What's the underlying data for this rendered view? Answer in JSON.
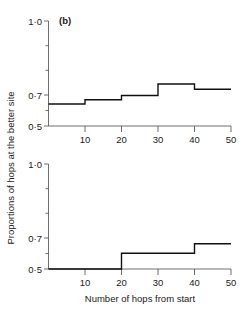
{
  "figure": {
    "panel_label": "(b)",
    "xlabel": "Number of hops from start",
    "ylabel": "Proportions of hops at the better site",
    "background_color": "#ffffff",
    "line_color": "#101010",
    "axis_color": "#4a4a4a"
  },
  "chart_data": [
    {
      "type": "line",
      "subtype": "step",
      "panel": "(b) upper",
      "title": "(b)",
      "xlabel": "",
      "ylabel": "Proportions of hops at the better site",
      "xlim": [
        0,
        50
      ],
      "ylim": [
        0.5,
        1.0
      ],
      "xticks": [
        10,
        20,
        30,
        40,
        50
      ],
      "xtick_labels": [
        "10",
        "20",
        "30",
        "40",
        "50"
      ],
      "yticks": [
        0.5,
        0.7,
        1.0
      ],
      "ytick_labels": [
        "0·5",
        "0·7",
        "1·0"
      ],
      "yminor_ticks": [
        0.6,
        0.8,
        0.9
      ],
      "grid": false,
      "legend": null,
      "x_edges": [
        0,
        10,
        20,
        30,
        40,
        50
      ],
      "values": [
        0.605,
        0.625,
        0.645,
        0.7,
        0.675
      ],
      "series": [
        {
          "name": "proportion at better site",
          "x_edges": [
            0,
            10,
            20,
            30,
            40,
            50
          ],
          "values": [
            0.605,
            0.625,
            0.645,
            0.7,
            0.675
          ]
        }
      ]
    },
    {
      "type": "line",
      "subtype": "step",
      "panel": "(b) lower",
      "title": "",
      "xlabel": "Number of hops from start",
      "ylabel": "Proportions of hops at the better site",
      "xlim": [
        0,
        50
      ],
      "ylim": [
        0.5,
        1.0
      ],
      "xticks": [
        10,
        20,
        30,
        40,
        50
      ],
      "xtick_labels": [
        "10",
        "20",
        "30",
        "40",
        "50"
      ],
      "yticks": [
        0.5,
        0.7,
        1.0
      ],
      "ytick_labels": [
        "0·5",
        "0·7",
        "1·0"
      ],
      "yminor_ticks": [
        0.6,
        0.8,
        0.9
      ],
      "grid": false,
      "legend": null,
      "x_edges": [
        0,
        20,
        40,
        50
      ],
      "values": [
        0.5,
        0.575,
        0.62
      ],
      "series": [
        {
          "name": "proportion at better site",
          "x_edges": [
            0,
            20,
            40,
            50
          ],
          "values": [
            0.5,
            0.575,
            0.62
          ]
        }
      ]
    }
  ]
}
